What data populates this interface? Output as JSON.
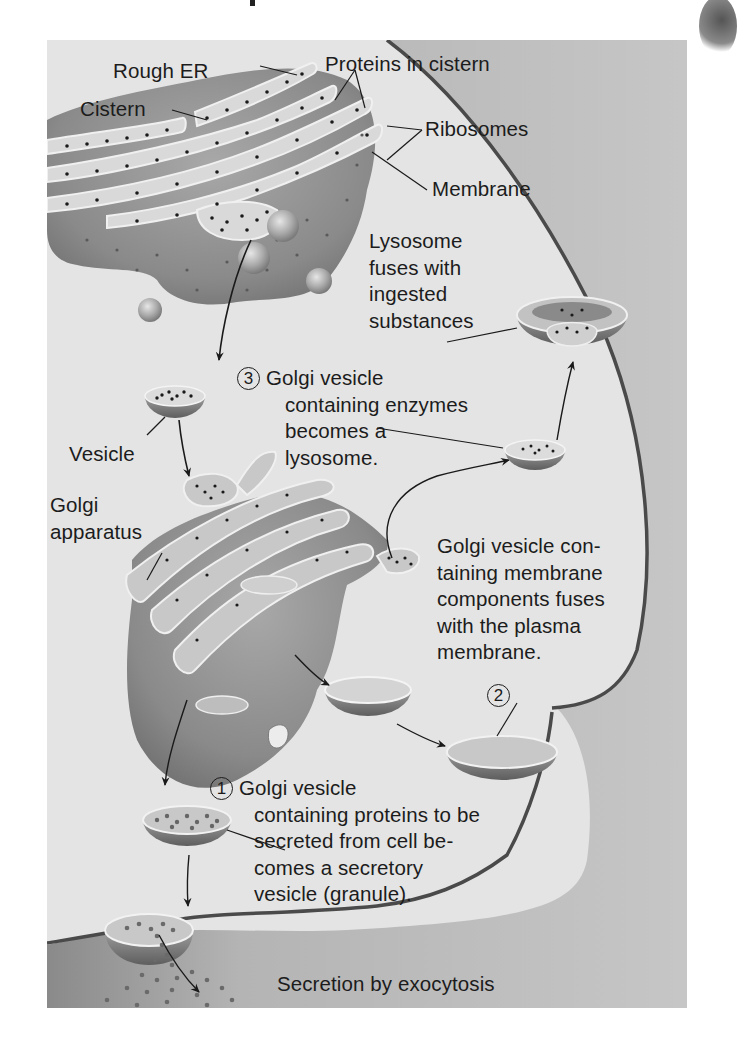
{
  "diagram": {
    "colors": {
      "background": "#e4e4e4",
      "page": "#ffffff",
      "organelle_fill": "#8e8e8e",
      "organelle_dark": "#6a6a6a",
      "membrane_highlight": "#f2f2f2",
      "protein_dot": "#1a1a1a",
      "text": "#1c1c1c",
      "plasma_membrane": "#4a4a4a",
      "extracellular": "#b8b8b8"
    },
    "labels": {
      "rough_er": "Rough ER",
      "cistern": "Cistern",
      "proteins_in_cistern": "Proteins in cistern",
      "ribosomes": "Ribosomes",
      "membrane": "Membrane",
      "lysosome_fuses": [
        "Lysosome",
        "fuses with",
        "ingested",
        "substances"
      ],
      "vesicle": "Vesicle",
      "golgi_apparatus": [
        "Golgi",
        "apparatus"
      ],
      "step3": {
        "number": "3",
        "lines": [
          "Golgi vesicle",
          "containing enzymes",
          "becomes a",
          "lysosome."
        ]
      },
      "step2_text": [
        "Golgi vesicle con-",
        "taining membrane",
        "components fuses",
        "with the plasma",
        "membrane."
      ],
      "step2_number": "2",
      "step1": {
        "number": "1",
        "lines": [
          "Golgi vesicle",
          "containing proteins to be",
          "secreted from cell be-",
          "comes a secretory",
          "vesicle (granule)."
        ]
      },
      "secretion": "Secretion by exocytosis"
    }
  }
}
